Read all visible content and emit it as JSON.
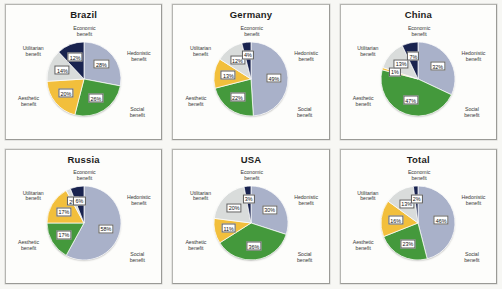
{
  "figure": {
    "categories": [
      "Hedonistic benefit",
      "Social benefit",
      "Aesthetic benefit",
      "Utilitarian benefit",
      "Economic benefit"
    ],
    "colors": {
      "hedonistic": "#a9b1c9",
      "social": "#44993c",
      "aesthetic": "#f2bf3c",
      "utilitarian": "#d9dcdb",
      "economic": "#19234f"
    }
  },
  "chart_data": [
    {
      "type": "pie",
      "title": "Brazil",
      "labels": [
        "Hedonistic benefit",
        "Social benefit",
        "Aesthetic benefit",
        "Utilitarian benefit",
        "Economic benefit"
      ],
      "values": [
        28,
        26,
        20,
        14,
        12
      ],
      "value_labels": [
        "28%",
        "26%",
        "20%",
        "14%",
        "12%"
      ],
      "legend": "none",
      "grid": false
    },
    {
      "type": "pie",
      "title": "Germany",
      "labels": [
        "Hedonistic benefit",
        "Social benefit",
        "Aesthetic benefit",
        "Utilitarian benefit",
        "Economic benefit"
      ],
      "values": [
        49,
        22,
        13,
        12,
        4
      ],
      "value_labels": [
        "49%",
        "22%",
        "13%",
        "12%",
        "4%"
      ],
      "legend": "none",
      "grid": false
    },
    {
      "type": "pie",
      "title": "China",
      "labels": [
        "Hedonistic benefit",
        "Social benefit",
        "Aesthetic benefit",
        "Utilitarian benefit",
        "Economic benefit"
      ],
      "values": [
        32,
        47,
        1,
        13,
        7
      ],
      "value_labels": [
        "32%",
        "47%",
        "1%",
        "13%",
        "7%"
      ],
      "legend": "none",
      "grid": false
    },
    {
      "type": "pie",
      "title": "Russia",
      "labels": [
        "Hedonistic benefit",
        "Social benefit",
        "Aesthetic benefit",
        "Utilitarian benefit",
        "Economic benefit"
      ],
      "values": [
        58,
        17,
        17,
        2,
        6
      ],
      "value_labels": [
        "58%",
        "17%",
        "17%",
        "2%",
        "6%"
      ],
      "legend": "none",
      "grid": false
    },
    {
      "type": "pie",
      "title": "USA",
      "labels": [
        "Hedonistic benefit",
        "Social benefit",
        "Aesthetic benefit",
        "Utilitarian benefit",
        "Economic benefit"
      ],
      "values": [
        30,
        36,
        11,
        20,
        3
      ],
      "value_labels": [
        "30%",
        "36%",
        "11%",
        "20%",
        "3%"
      ],
      "legend": "none",
      "grid": false
    },
    {
      "type": "pie",
      "title": "Total",
      "labels": [
        "Hedonistic benefit",
        "Social benefit",
        "Aesthetic benefit",
        "Utilitarian benefit",
        "Economic benefit"
      ],
      "values": [
        46,
        23,
        16,
        13,
        2
      ],
      "value_labels": [
        "46%",
        "23%",
        "16%",
        "13%",
        "2%"
      ],
      "legend": "none",
      "grid": false
    }
  ],
  "labels": {
    "hedonistic_line1": "Hedonistic",
    "hedonistic_line2": "benefit",
    "social_line1": "Social",
    "social_line2": "benefit",
    "aesthetic_line1": "Aesthetic",
    "aesthetic_line2": "benefit",
    "utilitarian_line1": "Utilitarian",
    "utilitarian_line2": "benefit",
    "economic_line1": "Economic",
    "economic_line2": "benefit"
  }
}
